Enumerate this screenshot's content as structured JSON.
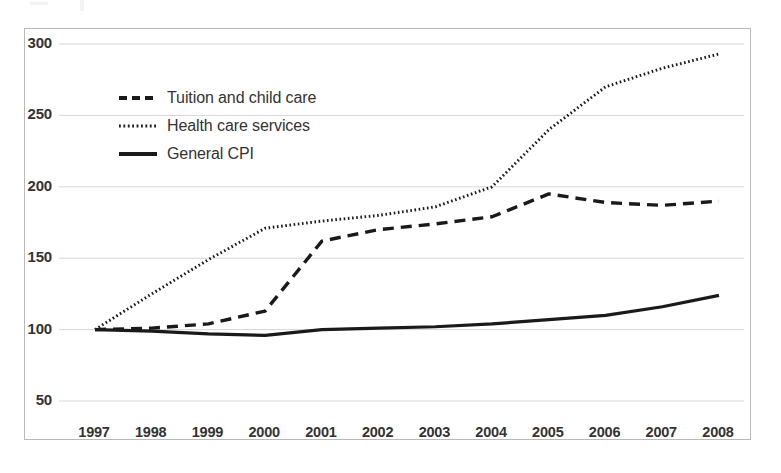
{
  "chart_data": {
    "type": "line",
    "title": "",
    "subtitle": "",
    "xlabel": "",
    "ylabel": "",
    "x": [
      1997,
      1998,
      1999,
      2000,
      2001,
      2002,
      2003,
      2004,
      2005,
      2006,
      2007,
      2008
    ],
    "categories": [
      "1997",
      "1998",
      "1999",
      "2000",
      "2001",
      "2002",
      "2003",
      "2004",
      "2005",
      "2006",
      "2007",
      "2008"
    ],
    "xlim": [
      1997,
      2008
    ],
    "ylim": [
      50,
      300
    ],
    "yticks": [
      50,
      100,
      150,
      200,
      250,
      300
    ],
    "ytick_labels": [
      "50",
      "100",
      "150",
      "200",
      "250",
      "300"
    ],
    "grid": "horizontal",
    "legend_position": "upper-left-inside",
    "series": [
      {
        "name": "Tuition and child care",
        "style": "dashed",
        "color": "#1a1a1a",
        "values": [
          100,
          101,
          104,
          113,
          162,
          170,
          174,
          179,
          195,
          189,
          187,
          190
        ]
      },
      {
        "name": "Health care services",
        "style": "dotted",
        "color": "#1a1a1a",
        "values": [
          100,
          125,
          149,
          171,
          176,
          180,
          186,
          200,
          240,
          270,
          283,
          293
        ]
      },
      {
        "name": "General CPI",
        "style": "solid",
        "color": "#1a1a1a",
        "values": [
          100,
          99,
          97,
          96,
          100,
          101,
          102,
          104,
          107,
          110,
          116,
          124
        ]
      }
    ]
  },
  "legend": {
    "items": [
      {
        "label": "Tuition and child care",
        "style": "dashed"
      },
      {
        "label": "Health care services",
        "style": "dotted"
      },
      {
        "label": "General CPI",
        "style": "solid"
      }
    ]
  },
  "colors": {
    "ink": "#1a1a1a",
    "axis": "#b9b9b9",
    "grid": "#d6d6d6",
    "text": "#333333",
    "background": "#ffffff"
  }
}
